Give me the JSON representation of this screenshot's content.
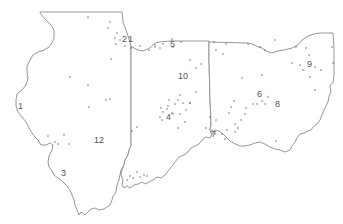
{
  "map": {
    "title": "",
    "regions": [
      {
        "name": "Illinois",
        "id": "illinois"
      },
      {
        "name": "Indiana",
        "id": "indiana"
      },
      {
        "name": "Ohio",
        "id": "ohio"
      }
    ],
    "colors": {
      "outline": "#8a8a8a",
      "point": "#555555",
      "label": "#555555",
      "background": "#ffffff"
    },
    "cluster_labels": [
      {
        "text": "1",
        "x": 18,
        "y": 109
      },
      {
        "text": "2",
        "x": 122,
        "y": 42
      },
      {
        "text": "1",
        "x": 128,
        "y": 42
      },
      {
        "text": "3",
        "x": 61,
        "y": 176
      },
      {
        "text": "4",
        "x": 166,
        "y": 120
      },
      {
        "text": "5",
        "x": 170,
        "y": 47
      },
      {
        "text": "6",
        "x": 257,
        "y": 97
      },
      {
        "text": "7",
        "x": 211,
        "y": 137
      },
      {
        "text": "8",
        "x": 275,
        "y": 107
      },
      {
        "text": "9",
        "x": 307,
        "y": 67
      },
      {
        "text": "10",
        "x": 178,
        "y": 79
      },
      {
        "text": "12",
        "x": 94,
        "y": 143
      }
    ],
    "points": [
      [
        88,
        17
      ],
      [
        110,
        22
      ],
      [
        108,
        28
      ],
      [
        117,
        33
      ],
      [
        115,
        38
      ],
      [
        120,
        40
      ],
      [
        116,
        44
      ],
      [
        125,
        46
      ],
      [
        131,
        48
      ],
      [
        140,
        46
      ],
      [
        149,
        50
      ],
      [
        155,
        45
      ],
      [
        163,
        44
      ],
      [
        172,
        39
      ],
      [
        181,
        42
      ],
      [
        70,
        77
      ],
      [
        88,
        85
      ],
      [
        111,
        59
      ],
      [
        106,
        100
      ],
      [
        110,
        99
      ],
      [
        89,
        107
      ],
      [
        64,
        135
      ],
      [
        48,
        136
      ],
      [
        55,
        142
      ],
      [
        58,
        144
      ],
      [
        69,
        144
      ],
      [
        173,
        47
      ],
      [
        190,
        60
      ],
      [
        196,
        68
      ],
      [
        201,
        64
      ],
      [
        160,
        48
      ],
      [
        155,
        47
      ],
      [
        214,
        42
      ],
      [
        226,
        44
      ],
      [
        216,
        50
      ],
      [
        223,
        54
      ],
      [
        248,
        44
      ],
      [
        260,
        47
      ],
      [
        265,
        50
      ],
      [
        275,
        40
      ],
      [
        296,
        47
      ],
      [
        306,
        48
      ],
      [
        309,
        55
      ],
      [
        292,
        63
      ],
      [
        300,
        65
      ],
      [
        303,
        70
      ],
      [
        315,
        67
      ],
      [
        333,
        63
      ],
      [
        332,
        47
      ],
      [
        321,
        70
      ],
      [
        310,
        77
      ],
      [
        315,
        90
      ],
      [
        262,
        75
      ],
      [
        242,
        78
      ],
      [
        234,
        101
      ],
      [
        246,
        108
      ],
      [
        253,
        104
      ],
      [
        257,
        104
      ],
      [
        262,
        101
      ],
      [
        268,
        97
      ],
      [
        265,
        104
      ],
      [
        231,
        107
      ],
      [
        229,
        113
      ],
      [
        245,
        114
      ],
      [
        241,
        120
      ],
      [
        235,
        124
      ],
      [
        238,
        128
      ],
      [
        227,
        130
      ],
      [
        212,
        130
      ],
      [
        222,
        134
      ],
      [
        215,
        134
      ],
      [
        225,
        139
      ],
      [
        206,
        128
      ],
      [
        216,
        120
      ],
      [
        210,
        117
      ],
      [
        185,
        122
      ],
      [
        173,
        114
      ],
      [
        161,
        108
      ],
      [
        163,
        112
      ],
      [
        167,
        109
      ],
      [
        168,
        106
      ],
      [
        172,
        113
      ],
      [
        180,
        114
      ],
      [
        186,
        110
      ],
      [
        183,
        103
      ],
      [
        178,
        100
      ],
      [
        169,
        100
      ],
      [
        175,
        104
      ],
      [
        190,
        103
      ],
      [
        162,
        120
      ],
      [
        178,
        128
      ],
      [
        160,
        117
      ],
      [
        132,
        131
      ],
      [
        137,
        127
      ],
      [
        130,
        176
      ],
      [
        133,
        178
      ],
      [
        137,
        172
      ],
      [
        140,
        177
      ],
      [
        144,
        175
      ],
      [
        127,
        180
      ],
      [
        147,
        176
      ],
      [
        180,
        95
      ],
      [
        190,
        103
      ],
      [
        196,
        92
      ],
      [
        235,
        132
      ],
      [
        276,
        141
      ]
    ]
  }
}
